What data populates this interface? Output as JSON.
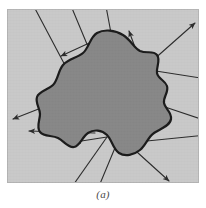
{
  "figure": {
    "caption": "(a)",
    "panel": {
      "background_color": "#c9c9c9",
      "border_color": "#b4b4b4",
      "x": 7,
      "y": 9,
      "width": 192,
      "height": 174
    },
    "region": {
      "name": "closed-region-blob",
      "fill_color": "#878787",
      "stroke_color": "#1a1a1a",
      "stroke_width": 2.2,
      "path": "M 90 24 C 97 20, 108 21, 116 26 C 124 31, 127 39, 133 42 C 140 45, 146 41, 150 46 C 154 51, 149 58, 150 64 C 151 70, 158 71, 160 77 C 162 83, 156 88, 157 94 C 158 100, 165 103, 164 110 C 163 117, 153 120, 147 124 C 141 128, 139 136, 133 141 C 127 146, 118 148, 112 144 C 106 140, 105 131, 100 126 C 95 121, 87 120, 81 124 C 75 128, 73 137, 67 138 C 61 139, 57 132, 51 129 C 45 126, 37 128, 33 123 C 29 118, 33 111, 33 105 C 33 99, 28 94, 30 88 C 32 82, 41 81, 46 76 C 51 71, 51 62, 56 56 C 61 50, 70 49, 76 44 C 82 39, 83 28, 90 24 Z"
    },
    "line_color": "#2b2b2b",
    "line_width": 1.1,
    "rays": [
      {
        "name": "ray-top-left-outer",
        "x1": 60,
        "y1": 60,
        "x2": 24,
        "y2": -8,
        "arrow": false
      },
      {
        "name": "ray-top-center-left",
        "x1": 82,
        "y1": 40,
        "x2": 62,
        "y2": -8,
        "arrow": false
      },
      {
        "name": "ray-top-center-right",
        "x1": 104,
        "y1": 24,
        "x2": 98,
        "y2": -8,
        "arrow": false
      },
      {
        "name": "arrow-upper-left",
        "x1": 104,
        "y1": 24,
        "x2": 54,
        "y2": 47,
        "arrow": true
      },
      {
        "name": "arrow-up-right-short",
        "x1": 136,
        "y1": 60,
        "x2": 122,
        "y2": 22,
        "arrow": true
      },
      {
        "name": "arrow-up-right-long",
        "x1": 136,
        "y1": 60,
        "x2": 188,
        "y2": 14,
        "arrow": true
      },
      {
        "name": "ray-right-upper",
        "x1": 136,
        "y1": 60,
        "x2": 200,
        "y2": 70,
        "arrow": false
      },
      {
        "name": "arrow-right-mid",
        "x1": 152,
        "y1": 96,
        "x2": 157,
        "y2": 77,
        "arrow": true
      },
      {
        "name": "ray-right-lower",
        "x1": 152,
        "y1": 96,
        "x2": 200,
        "y2": 112,
        "arrow": false
      },
      {
        "name": "arrow-left-upper",
        "x1": 52,
        "y1": 92,
        "x2": 6,
        "y2": 110,
        "arrow": true
      },
      {
        "name": "arrow-left-lower",
        "x1": 88,
        "y1": 124,
        "x2": 22,
        "y2": 122,
        "arrow": true
      },
      {
        "name": "arrow-left-inner",
        "x1": 100,
        "y1": 128,
        "x2": 68,
        "y2": 133,
        "arrow": true
      },
      {
        "name": "ray-bottom-left",
        "x1": 100,
        "y1": 128,
        "x2": 62,
        "y2": 182,
        "arrow": false
      },
      {
        "name": "ray-bottom-center",
        "x1": 110,
        "y1": 134,
        "x2": 90,
        "y2": 182,
        "arrow": false
      },
      {
        "name": "arrow-down-right",
        "x1": 120,
        "y1": 134,
        "x2": 162,
        "y2": 172,
        "arrow": true
      },
      {
        "name": "ray-right-from-lobe",
        "x1": 120,
        "y1": 134,
        "x2": 200,
        "y2": 126,
        "arrow": false
      }
    ]
  }
}
